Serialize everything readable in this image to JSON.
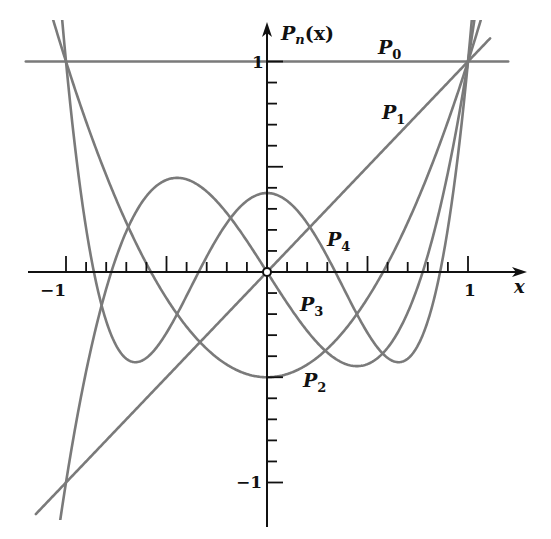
{
  "chart_data": {
    "type": "line",
    "title": "",
    "xlabel": "x",
    "ylabel": "P_n(x)",
    "xlim": [
      -1.2,
      1.25
    ],
    "ylim": [
      -1.25,
      1.2
    ],
    "x_ticks": {
      "minor_step": 0.1,
      "major": [
        -1,
        -0.5,
        0.5,
        1
      ],
      "labels": [
        "-1",
        "1"
      ]
    },
    "y_ticks": {
      "minor_step": 0.1,
      "major": [
        -1,
        -0.5,
        0.5,
        1
      ],
      "labels": [
        "1",
        "-1"
      ]
    },
    "grid": false,
    "origin_marker": "open-circle",
    "series": [
      {
        "name": "P0",
        "label_sub": "0",
        "formula": "1",
        "coeffs": [
          1
        ],
        "x_range": [
          -1.2,
          1.2
        ],
        "label_pos": [
          378,
          54
        ],
        "sample_values": {
          "x": [
            -1,
            0,
            1
          ],
          "y": [
            1,
            1,
            1
          ]
        }
      },
      {
        "name": "P1",
        "label_sub": "1",
        "formula": "x",
        "coeffs": [
          0,
          1
        ],
        "x_range": [
          -1.15,
          1.11
        ],
        "label_pos": [
          382,
          119
        ],
        "sample_values": {
          "x": [
            -1,
            0,
            1
          ],
          "y": [
            -1,
            0,
            1
          ]
        }
      },
      {
        "name": "P2",
        "label_sub": "2",
        "formula": "(3x^2 - 1)/2",
        "coeffs": [
          -0.5,
          0,
          1.5
        ],
        "x_range": [
          -1.08,
          1.08
        ],
        "label_pos": [
          303,
          387
        ],
        "sample_values": {
          "x": [
            -1,
            -0.577,
            0,
            0.577,
            1
          ],
          "y": [
            1,
            0,
            -0.5,
            0,
            1
          ]
        }
      },
      {
        "name": "P3",
        "label_sub": "3",
        "formula": "(5x^3 - 3x)/2",
        "coeffs": [
          0,
          -1.5,
          0,
          2.5
        ],
        "x_range": [
          -1.04,
          1.04
        ],
        "label_pos": [
          300,
          311
        ],
        "sample_values": {
          "x": [
            -1,
            -0.447,
            0,
            0.447,
            1
          ],
          "y": [
            -1,
            0.447,
            0,
            -0.447,
            1
          ]
        }
      },
      {
        "name": "P4",
        "label_sub": "4",
        "formula": "(35x^4 - 30x^2 + 3)/8",
        "coeffs": [
          0.375,
          0,
          -3.75,
          0,
          4.375
        ],
        "x_range": [
          -1.03,
          1.03
        ],
        "label_pos": [
          327,
          246
        ],
        "sample_values": {
          "x": [
            -1,
            -0.655,
            0,
            0.655,
            1
          ],
          "y": [
            1,
            -0.429,
            0.375,
            -0.429,
            1
          ]
        }
      }
    ],
    "annotations": [
      "P_n(x)",
      "P0",
      "P1",
      "P2",
      "P3",
      "P4"
    ]
  },
  "axis_labels": {
    "y_axis": "P",
    "y_axis_sub": "n",
    "y_axis_arg": "(x)",
    "x_axis": "x",
    "x_tick_neg1": "−1",
    "x_tick_1": "1",
    "y_tick_1": "1",
    "y_tick_neg1": "−1"
  },
  "colors": {
    "curve": "#7a7a7a",
    "axis": "#111111",
    "background": "#ffffff"
  }
}
